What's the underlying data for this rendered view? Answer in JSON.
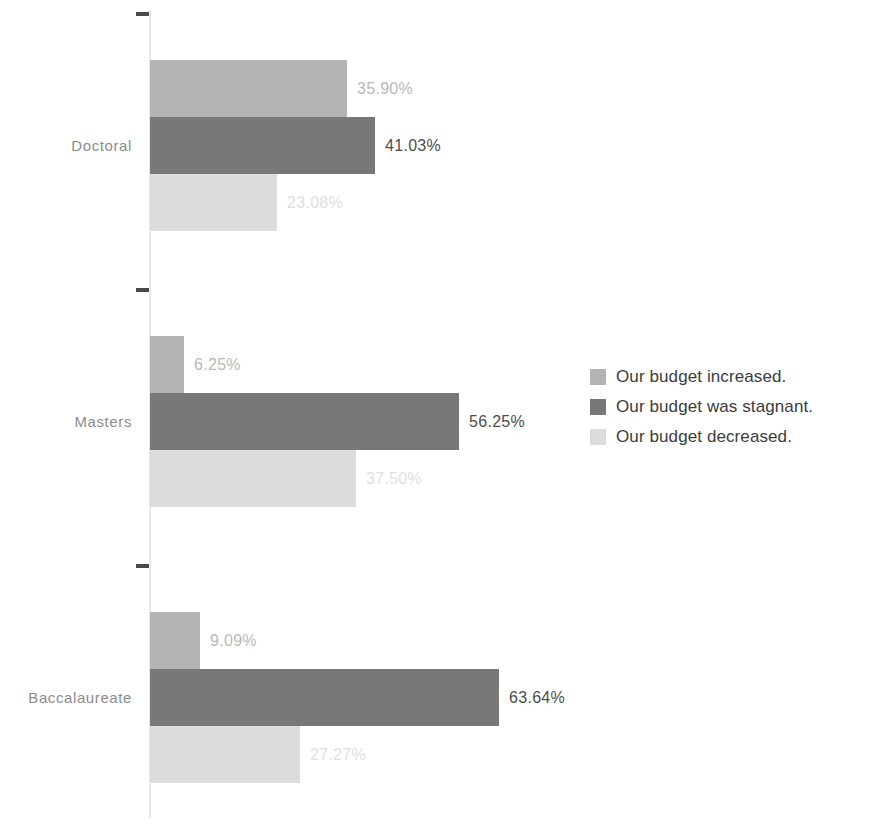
{
  "chart_data": {
    "type": "bar",
    "orientation": "horizontal",
    "title": "",
    "subtitle": "",
    "xlabel": "",
    "ylabel": "",
    "grid": false,
    "legend_position": "right",
    "value_suffix": "%",
    "xlim": [
      0,
      70
    ],
    "categories": [
      "Doctoral",
      "Masters",
      "Baccalaureate"
    ],
    "series": [
      {
        "name": "Our budget increased.",
        "color": "#b4b4b4",
        "label_color": "#b9b9b9",
        "values": [
          35.9,
          6.25,
          9.09
        ],
        "labels": [
          "35.90%",
          "6.25%",
          "9.09%"
        ]
      },
      {
        "name": "Our budget was stagnant.",
        "color": "#787878",
        "label_color": "#4d4d4d",
        "values": [
          41.03,
          56.25,
          63.64
        ],
        "labels": [
          "41.03%",
          "56.25%",
          "63.64%"
        ]
      },
      {
        "name": "Our budget decreased.",
        "color": "#dcdcdc",
        "label_color": "#e0e0e0",
        "values": [
          23.08,
          37.5,
          27.27
        ],
        "labels": [
          "23.08%",
          "37.50%",
          "27.27%"
        ]
      }
    ]
  },
  "axis": {
    "line_color": "#e8e8e8",
    "tick_color": "#4a4a4a",
    "category_label_color": "#8c8c8c"
  },
  "legend": {
    "items": [
      {
        "label": "Our budget increased.",
        "color": "#b4b4b4"
      },
      {
        "label": "Our budget was stagnant.",
        "color": "#787878"
      },
      {
        "label": "Our budget decreased.",
        "color": "#dcdcdc"
      }
    ]
  }
}
